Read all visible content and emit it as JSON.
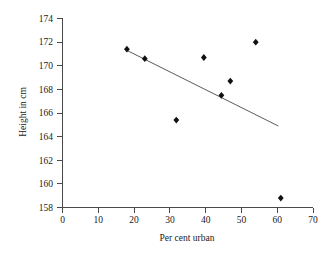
{
  "chart_data": {
    "type": "scatter",
    "title": "",
    "xlabel": "Per cent urban",
    "ylabel": "Height in cm",
    "xlim": [
      0,
      70
    ],
    "ylim": [
      158,
      174
    ],
    "xticks": [
      0,
      10,
      20,
      30,
      40,
      50,
      60,
      70
    ],
    "yticks": [
      158,
      160,
      162,
      164,
      166,
      168,
      170,
      172,
      174
    ],
    "xtick_labels": [
      "0",
      "10",
      "20",
      "30",
      "40",
      "50",
      "60",
      "70"
    ],
    "ytick_labels": [
      "158",
      "160",
      "162",
      "164",
      "166",
      "168",
      "170",
      "172",
      "174"
    ],
    "grid": false,
    "legend": false,
    "series": [
      {
        "name": "observations",
        "marker": "filled-diamond",
        "color": "#111111",
        "x": [
          18.0,
          23.0,
          31.8,
          39.5,
          44.4,
          46.9,
          54.0,
          61.0
        ],
        "y": [
          171.4,
          170.6,
          165.4,
          170.7,
          167.5,
          168.7,
          172.0,
          158.8
        ]
      }
    ],
    "trend_line": {
      "name": "regression-line",
      "color": "#5a5a5a",
      "x": [
        18.0,
        60.3
      ],
      "y": [
        171.3,
        164.9
      ]
    }
  },
  "axis": {
    "x_title": "Per cent urban",
    "y_title": "Height in cm"
  }
}
